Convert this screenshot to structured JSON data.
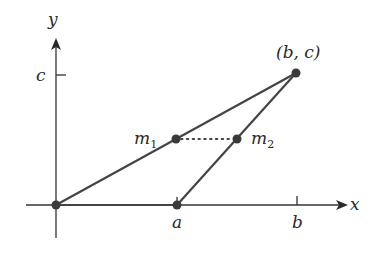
{
  "diagram": {
    "type": "coordinate-geometry",
    "colors": {
      "line": "#444444",
      "point": "#3a3a3a",
      "text": "#2a2a2a",
      "background": "#ffffff"
    },
    "axes": {
      "x_label": "x",
      "y_label": "y"
    },
    "ticks": {
      "x": [
        {
          "label": "a"
        },
        {
          "label": "b"
        }
      ],
      "y": [
        {
          "label": "c"
        }
      ]
    },
    "points": [
      {
        "id": "origin",
        "label": ""
      },
      {
        "id": "A",
        "label": "a"
      },
      {
        "id": "P",
        "label": "(b, c)"
      },
      {
        "id": "m1",
        "label": "m",
        "subscript": "1"
      },
      {
        "id": "m2",
        "label": "m",
        "subscript": "2"
      }
    ],
    "segments": [
      {
        "from": "origin",
        "to": "A",
        "style": "solid"
      },
      {
        "from": "origin",
        "to": "P",
        "style": "solid"
      },
      {
        "from": "A",
        "to": "P",
        "style": "solid"
      },
      {
        "from": "m1",
        "to": "m2",
        "style": "dotted"
      }
    ]
  }
}
